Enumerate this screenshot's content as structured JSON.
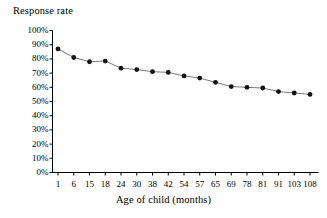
{
  "chart_data": {
    "type": "line",
    "title": "",
    "ylabel": "Response rate",
    "xlabel": "Age of child (months)",
    "categories": [
      "1",
      "6",
      "15",
      "18",
      "24",
      "30",
      "38",
      "42",
      "54",
      "57",
      "65",
      "69",
      "78",
      "81",
      "91",
      "103",
      "108"
    ],
    "values": [
      87,
      81,
      78,
      78.5,
      73.5,
      72.5,
      71,
      70.5,
      68,
      66.5,
      63.5,
      60.5,
      60,
      59.5,
      57,
      56,
      55
    ],
    "ytick_labels": [
      "100%",
      "90%",
      "80%",
      "70%",
      "60%",
      "50%",
      "40%",
      "30%",
      "20%",
      "10%",
      "0%"
    ],
    "ytick_values": [
      100,
      90,
      80,
      70,
      60,
      50,
      40,
      30,
      20,
      10,
      0
    ],
    "ylim": [
      0,
      100
    ],
    "grid": false,
    "legend": "none",
    "marker": "filled-circle",
    "marker_color": "#111111",
    "line_color": "#6b6b6b",
    "axis_color": "#000000",
    "background_color": "#ffffff"
  }
}
